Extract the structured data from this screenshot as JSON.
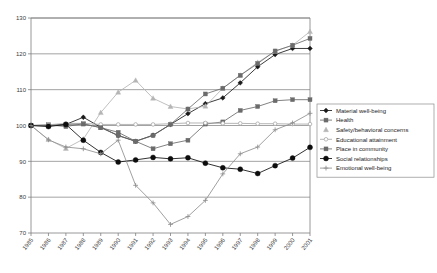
{
  "chart_data": {
    "type": "line",
    "title": "",
    "subtitle": "",
    "xlabel": "",
    "ylabel": "",
    "xlim": [
      1985,
      2001
    ],
    "ylim": [
      70,
      130
    ],
    "ytick_step": 10,
    "grid": true,
    "gridlines": "horizontal",
    "legend_position": "right",
    "x": [
      1985,
      1986,
      1987,
      1988,
      1989,
      1990,
      1991,
      1992,
      1993,
      1994,
      1995,
      1996,
      1997,
      1998,
      1999,
      2000,
      2001
    ],
    "xticklabels": [
      "1985",
      "1986",
      "1987",
      "1988",
      "1989",
      "1990",
      "1991",
      "1992",
      "1993",
      "1994",
      "1995",
      "1996",
      "1997",
      "1998",
      "1999",
      "2000",
      "2001"
    ],
    "yticklabels": [
      "130",
      "120",
      "110",
      "100",
      "90",
      "80",
      "70"
    ],
    "series": [
      {
        "name": "Material well-being",
        "marker": "diamond",
        "color": "#1a1a1a",
        "values": [
          100.0,
          100.0,
          100.3,
          102.3,
          99.5,
          97.2,
          95.6,
          97.3,
          100.3,
          103.3,
          106.1,
          107.7,
          111.9,
          116.4,
          119.8,
          121.5,
          121.5
        ]
      },
      {
        "name": "Health",
        "marker": "square",
        "color": "#6b6b6b",
        "values": [
          100.0,
          100.2,
          99.7,
          100.5,
          99.4,
          98.1,
          95.6,
          93.5,
          94.9,
          95.9,
          100.4,
          101.0,
          104.2,
          105.3,
          106.9,
          107.2,
          107.2
        ]
      },
      {
        "name": "Safety/behavioral concerns",
        "marker": "triangle",
        "color": "#b5b5b5",
        "values": [
          100.0,
          96.1,
          93.6,
          96.2,
          103.6,
          109.3,
          112.6,
          107.6,
          105.3,
          104.6,
          105.4,
          110.4,
          114.0,
          117.6,
          120.7,
          122.4,
          126.2
        ]
      },
      {
        "name": "Educational attainment",
        "marker": "circle-open",
        "color": "#a8a8a8",
        "values": [
          100.0,
          100.2,
          100.6,
          100.6,
          100.3,
          100.3,
          100.3,
          100.3,
          100.5,
          100.7,
          100.7,
          100.6,
          100.6,
          100.5,
          100.5,
          100.4,
          100.4
        ]
      },
      {
        "name": "Place in community",
        "marker": "square-dash",
        "color": "#6b6b6b",
        "values": [
          100.0,
          99.9,
          100.3,
          100.4,
          99.4,
          97.2,
          95.6,
          97.2,
          100.3,
          104.6,
          108.8,
          110.4,
          114.0,
          117.3,
          120.8,
          122.4,
          124.3
        ]
      },
      {
        "name": "Social relationships",
        "marker": "circle-filled",
        "color": "#0d0d0d",
        "values": [
          100.0,
          99.7,
          100.3,
          95.9,
          92.5,
          89.8,
          90.4,
          91.1,
          90.7,
          91.0,
          89.5,
          88.2,
          87.8,
          86.6,
          88.8,
          90.9,
          93.9
        ]
      },
      {
        "name": "Emotional well-being",
        "marker": "plus",
        "color": "#8f8f8f",
        "values": [
          100.0,
          96.0,
          94.0,
          93.5,
          92.1,
          95.9,
          83.3,
          78.4,
          72.4,
          74.6,
          79.1,
          86.5,
          92.1,
          94.0,
          98.8,
          100.7,
          103.4
        ]
      }
    ]
  },
  "legend": {
    "items": [
      {
        "label": "Material well-being",
        "marker": "diamond",
        "color": "#1a1a1a"
      },
      {
        "label": "Health",
        "marker": "square",
        "color": "#6b6b6b"
      },
      {
        "label": "Safety/behavioral concerns",
        "marker": "triangle",
        "color": "#b5b5b5"
      },
      {
        "label": "Educational attainment",
        "marker": "circle-open",
        "color": "#a8a8a8"
      },
      {
        "label": "Place in community",
        "marker": "square-dash",
        "color": "#6b6b6b"
      },
      {
        "label": "Social relationships",
        "marker": "circle-filled",
        "color": "#0d0d0d"
      },
      {
        "label": "Emotional well-being",
        "marker": "plus",
        "color": "#8f8f8f"
      }
    ]
  },
  "colors": {
    "background": "#ffffff",
    "axis": "#7f7f7f",
    "grid": "#8c8c8c",
    "text": "#1c1c1c"
  }
}
